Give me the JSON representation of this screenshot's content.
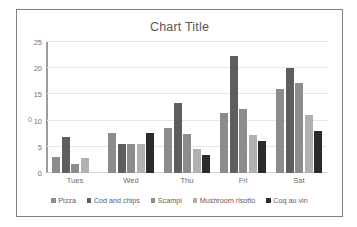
{
  "chart_data": {
    "type": "bar",
    "title": "Chart Title",
    "xlabel": "",
    "ylabel": "",
    "ylim": [
      0,
      25
    ],
    "yticks": [
      0,
      5,
      10,
      15,
      20,
      25
    ],
    "grid": true,
    "legend_position": "bottom",
    "categories": [
      "Tues",
      "Wed",
      "Thu",
      "Fri",
      "Sat"
    ],
    "series": [
      {
        "name": "Pizza",
        "color": "#8c8c8c",
        "values": [
          3.0,
          7.7,
          8.6,
          11.4,
          16.1
        ]
      },
      {
        "name": "Cod and chips",
        "color": "#5e5e5e",
        "values": [
          6.8,
          5.6,
          13.4,
          22.3,
          20.1
        ]
      },
      {
        "name": "Scampi",
        "color": "#8c8c8c",
        "values": [
          1.8,
          5.5,
          7.5,
          12.2,
          17.1
        ]
      },
      {
        "name": "Mushroom risotto",
        "color": "#b0b0b0",
        "values": [
          2.8,
          5.5,
          4.5,
          7.3,
          11.1
        ]
      },
      {
        "name": "Coq au vin",
        "color": "#2b2b2b",
        "values": [
          null,
          7.6,
          3.4,
          6.2,
          8.1
        ]
      }
    ],
    "axis_stray_mark": "0"
  }
}
